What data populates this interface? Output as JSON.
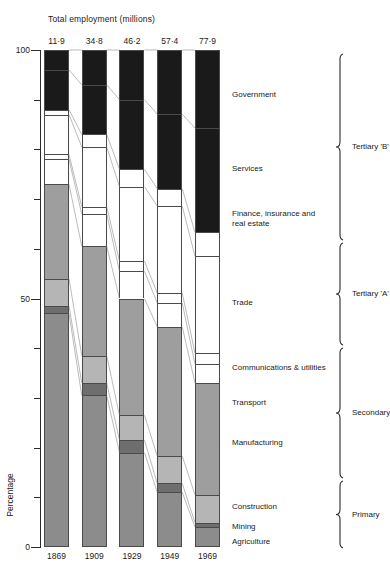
{
  "chart_data": {
    "type": "bar",
    "subtype": "stacked-100-percent",
    "title": "Total employment (millions)",
    "xlabel": "",
    "ylabel": "Percentage",
    "ylim": [
      0,
      100
    ],
    "yticks": [
      0,
      10,
      20,
      30,
      40,
      50,
      60,
      70,
      80,
      90,
      100
    ],
    "ytick_labels": [
      "0",
      "",
      "",
      "",
      "",
      "50",
      "",
      "",
      "",
      "",
      "100"
    ],
    "grid": false,
    "legend": "right-side category labels with braces",
    "categories": [
      "1869",
      "1909",
      "1929",
      "1949",
      "1969"
    ],
    "totals": [
      "11·9",
      "34·8",
      "46·2",
      "57·4",
      "77·9"
    ],
    "totals_numeric": [
      11.9,
      34.8,
      46.2,
      57.4,
      77.9
    ],
    "totals_units": "millions",
    "series": [
      {
        "name": "Agriculture",
        "group": "Primary",
        "color": "#8c8c8c",
        "values": [
          47.0,
          30.5,
          19.0,
          11.0,
          4.0
        ]
      },
      {
        "name": "Mining",
        "group": "Primary",
        "color": "#6e6e6e",
        "values": [
          1.5,
          2.5,
          2.5,
          1.8,
          0.9
        ]
      },
      {
        "name": "Construction",
        "group": "Secondary",
        "color": "#b5b5b5",
        "values": [
          5.5,
          5.5,
          5.0,
          5.5,
          5.6
        ]
      },
      {
        "name": "Manufacturing",
        "group": "Secondary",
        "color": "#9e9e9e",
        "values": [
          19.0,
          22.0,
          23.5,
          26.0,
          22.5
        ]
      },
      {
        "name": "Transport",
        "group": "Tertiary 'A'",
        "color": "#ffffff",
        "values": [
          5.0,
          6.5,
          5.5,
          4.8,
          3.8
        ]
      },
      {
        "name": "Communications & utilities",
        "group": "Tertiary 'A'",
        "color": "#ffffff",
        "values": [
          1.0,
          1.5,
          2.0,
          2.0,
          2.2
        ]
      },
      {
        "name": "Trade",
        "group": "Tertiary 'A'",
        "color": "#ffffff",
        "values": [
          8.0,
          12.0,
          15.0,
          17.5,
          19.5
        ]
      },
      {
        "name": "Finance, insurance and real estate",
        "group": "Tertiary 'B'",
        "color": "#ffffff",
        "values": [
          1.0,
          2.5,
          3.5,
          3.5,
          4.8
        ]
      },
      {
        "name": "Services",
        "group": "Tertiary 'B'",
        "color": "#1a1a1a",
        "values": [
          8.0,
          10.0,
          14.0,
          15.0,
          21.0
        ]
      },
      {
        "name": "Government",
        "group": "Tertiary 'B'",
        "color": "#1a1a1a",
        "values": [
          4.0,
          7.0,
          10.0,
          12.9,
          15.7
        ]
      }
    ],
    "groups": [
      {
        "name": "Tertiary 'B'",
        "members": [
          "Finance, insurance and real estate",
          "Services",
          "Government"
        ]
      },
      {
        "name": "Tertiary 'A'",
        "members": [
          "Transport",
          "Communications & utilities",
          "Trade"
        ]
      },
      {
        "name": "Secondary",
        "members": [
          "Manufacturing",
          "Construction"
        ]
      },
      {
        "name": "Primary",
        "members": [
          "Mining",
          "Agriculture"
        ]
      }
    ],
    "annotations": [
      {
        "text": "Government",
        "y_pct": 91
      },
      {
        "text": "Services",
        "y_pct": 76
      },
      {
        "text": "Finance, insurance and real estate",
        "y_pct": 67
      },
      {
        "text": "Trade",
        "y_pct": 49
      },
      {
        "text": "Communications & utilities",
        "y_pct": 36
      },
      {
        "text": "Transport",
        "y_pct": 29
      },
      {
        "text": "Manufacturing",
        "y_pct": 21
      },
      {
        "text": "Construction",
        "y_pct": 8
      },
      {
        "text": "Mining",
        "y_pct": 4
      },
      {
        "text": "Agriculture",
        "y_pct": 1
      }
    ]
  },
  "colors": {
    "axis": "#2b2b2b",
    "text": "#1a1a1a",
    "background": "#ffffff",
    "black_segment": "#1a1a1a",
    "white_segment": "#ffffff",
    "light_gray": "#b5b5b5",
    "mid_gray": "#9e9e9e",
    "gray": "#8c8c8c",
    "dark_gray": "#6e6e6e"
  }
}
